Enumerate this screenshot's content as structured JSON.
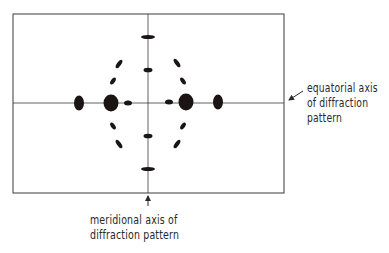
{
  "figure": {
    "type": "fiber diffraction pattern schematic",
    "frame": {
      "x": 13,
      "y": 14,
      "width": 271,
      "height": 179
    },
    "axes": {
      "equatorial_y": 103,
      "meridional_x": 148
    },
    "colors": {
      "ink": "#1a1414",
      "line": "#3a3a3a",
      "background": "#ffffff"
    }
  },
  "labels": {
    "equatorial": {
      "lines": [
        "equatorial axis",
        "of diffraction",
        "pattern"
      ]
    },
    "meridional": {
      "lines": [
        "meridional axis of",
        "diffraction pattern"
      ]
    }
  },
  "spots": {
    "equatorial": [
      {
        "cx": 79,
        "cy": 103,
        "rx": 5,
        "ry": 7.5
      },
      {
        "cx": 111,
        "cy": 103,
        "rx": 7.5,
        "ry": 8.5
      },
      {
        "cx": 128,
        "cy": 103,
        "rx": 4,
        "ry": 2.5
      },
      {
        "cx": 169,
        "cy": 102,
        "rx": 4,
        "ry": 2.5
      },
      {
        "cx": 186,
        "cy": 102,
        "rx": 7.5,
        "ry": 8.5
      },
      {
        "cx": 218,
        "cy": 102,
        "rx": 5,
        "ry": 7.5
      }
    ],
    "meridional": [
      {
        "cx": 148,
        "cy": 37,
        "rx": 7,
        "ry": 2
      },
      {
        "cx": 148,
        "cy": 70,
        "rx": 4.5,
        "ry": 2.3
      },
      {
        "cx": 148,
        "cy": 136,
        "rx": 4.5,
        "ry": 2.3
      },
      {
        "cx": 148,
        "cy": 169,
        "rx": 7,
        "ry": 2
      }
    ],
    "layer_line": [
      {
        "cx": 119,
        "cy": 64,
        "rx": 5,
        "ry": 2,
        "angle": -55
      },
      {
        "cx": 113,
        "cy": 81,
        "rx": 4,
        "ry": 2,
        "angle": -55
      },
      {
        "cx": 177,
        "cy": 63,
        "rx": 5,
        "ry": 2,
        "angle": 55
      },
      {
        "cx": 183,
        "cy": 81,
        "rx": 4,
        "ry": 2,
        "angle": 55
      },
      {
        "cx": 113,
        "cy": 126,
        "rx": 4,
        "ry": 2,
        "angle": 55
      },
      {
        "cx": 119,
        "cy": 144,
        "rx": 5,
        "ry": 2,
        "angle": 55
      },
      {
        "cx": 183,
        "cy": 126,
        "rx": 4,
        "ry": 2,
        "angle": -55
      },
      {
        "cx": 177,
        "cy": 144,
        "rx": 5,
        "ry": 2,
        "angle": -55
      }
    ]
  },
  "arrows": {
    "equatorial": {
      "x1": 303,
      "y1": 91,
      "x2": 289,
      "y2": 100
    },
    "meridional": {
      "x1": 148,
      "y1": 206,
      "x2": 148,
      "y2": 196
    }
  }
}
